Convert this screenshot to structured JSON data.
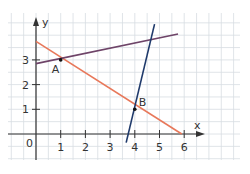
{
  "chart_data": {
    "type": "line",
    "title": "",
    "xlabel": "x",
    "ylabel": "y",
    "origin_label": "0",
    "x_ticks": [
      "1",
      "2",
      "3",
      "4",
      "5",
      "6"
    ],
    "y_ticks": [
      "1",
      "2",
      "3"
    ],
    "xlim": [
      -1.1,
      8.2
    ],
    "ylim": [
      -1.05,
      4.85
    ],
    "grid": true,
    "grid_step": 0.5,
    "series": [
      {
        "name": "red-line",
        "color": "#e8785a",
        "points": [
          [
            0,
            3.75
          ],
          [
            5.9,
            0
          ]
        ]
      },
      {
        "name": "purple-line",
        "color": "#6e4468",
        "points": [
          [
            0,
            2.85
          ],
          [
            5.75,
            4.05
          ]
        ]
      },
      {
        "name": "blue-line",
        "color": "#1f3a6b",
        "points": [
          [
            3.65,
            -0.35
          ],
          [
            4.8,
            4.45
          ]
        ]
      }
    ],
    "points": [
      {
        "label": "A",
        "x": 1,
        "y": 3
      },
      {
        "label": "B",
        "x": 4,
        "y": 1
      }
    ]
  },
  "colors": {
    "grid": "#d8dde2",
    "axis": "#333333"
  }
}
